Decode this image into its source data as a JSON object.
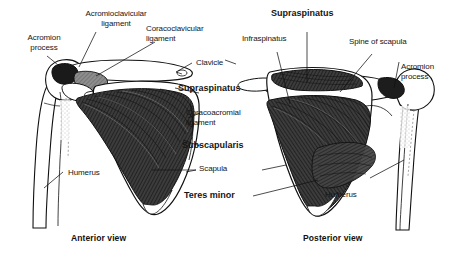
{
  "figure": {
    "background_color": "#ffffff",
    "ink_color": "#111111",
    "muscle_fill_color": "#3a3a3a",
    "bone_fill_color": "#ffffff"
  },
  "anterior": {
    "caption": "Anterior view",
    "labels": {
      "acromion_process": "Acromion\nprocess",
      "acromioclavicular_ligament": "Acromioclavicular\nligament",
      "coracoclavicular_ligament": "Coracoclavicular\nligament",
      "clavicle": "Clavicle",
      "supraspinatus": "Supraspinatus",
      "coracoacromial_ligament": "Coracoacromial\nligament",
      "subscapularis": "Subscapularis",
      "scapula": "Scapula",
      "teres_minor": "Teres minor",
      "humerus": "Humerus"
    }
  },
  "posterior": {
    "caption": "Posterior view",
    "labels": {
      "supraspinatus": "Supraspinatus",
      "infraspinatus": "Infraspinatus",
      "spine_of_scapula": "Spine of scapula",
      "acromion_process": "Acromion\nprocess",
      "humerus": "Humerus"
    }
  }
}
